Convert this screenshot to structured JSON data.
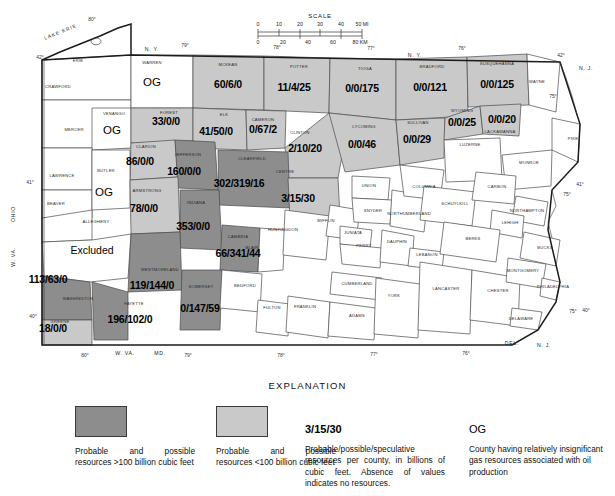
{
  "map": {
    "title_geographic": "Pennsylvania gas resources by county",
    "lake_label": "LAKE ERIE",
    "scale": {
      "title": "SCALE",
      "miles_ticks": [
        "0",
        "10",
        "20",
        "30",
        "40",
        "50 MI"
      ],
      "km_ticks": [
        "0",
        "20",
        "40",
        "60",
        "80 KM"
      ]
    },
    "neighbors": [
      {
        "name": "N. Y.",
        "x": 152,
        "y": 51
      },
      {
        "name": "N. Y.",
        "x": 415,
        "y": 57
      },
      {
        "name": "OHIO",
        "x": 15,
        "y": 214
      },
      {
        "name": "W. VA.",
        "x": 15,
        "y": 257
      },
      {
        "name": "W. VA.",
        "x": 125,
        "y": 355
      },
      {
        "name": "MD.",
        "x": 160,
        "y": 355
      },
      {
        "name": "DEL.",
        "x": 512,
        "y": 345
      },
      {
        "name": "N. J.",
        "x": 544,
        "y": 347
      },
      {
        "name": "N. J.",
        "x": 586,
        "y": 70
      }
    ],
    "graticule_labels": [
      {
        "t": "42°",
        "x": 40,
        "y": 59
      },
      {
        "t": "42°",
        "x": 561,
        "y": 57
      },
      {
        "t": "41°",
        "x": 30,
        "y": 184
      },
      {
        "t": "41°",
        "x": 580,
        "y": 186
      },
      {
        "t": "40°",
        "x": 33,
        "y": 318
      },
      {
        "t": "40°",
        "x": 586,
        "y": 312
      },
      {
        "t": "80°",
        "x": 92,
        "y": 21
      },
      {
        "t": "80°",
        "x": 85,
        "y": 357
      },
      {
        "t": "79°",
        "x": 185,
        "y": 47
      },
      {
        "t": "79°",
        "x": 188,
        "y": 357
      },
      {
        "t": "78°",
        "x": 277,
        "y": 49
      },
      {
        "t": "78°",
        "x": 281,
        "y": 357
      },
      {
        "t": "77°",
        "x": 371,
        "y": 50
      },
      {
        "t": "77°",
        "x": 374,
        "y": 356
      },
      {
        "t": "76°",
        "x": 462,
        "y": 50
      },
      {
        "t": "76°",
        "x": 466,
        "y": 355
      },
      {
        "t": "75°",
        "x": 553,
        "y": 98
      },
      {
        "t": "75°",
        "x": 567,
        "y": 196
      },
      {
        "t": "75°",
        "x": 573,
        "y": 313
      }
    ],
    "counties": [
      {
        "name": "ERIE",
        "shade": "none",
        "value": null,
        "lx": 78,
        "ly": 62
      },
      {
        "name": "CRAWFORD",
        "shade": "none",
        "value": null,
        "lx": 58,
        "ly": 88
      },
      {
        "name": "WARREN",
        "shade": "none",
        "value": "OG",
        "lx": 152,
        "ly": 64,
        "vx": 152,
        "vy": 86
      },
      {
        "name": "MCKEAN",
        "shade": "light",
        "value": "60/6/0",
        "lx": 228,
        "ly": 66,
        "vx": 228,
        "vy": 88
      },
      {
        "name": "POTTER",
        "shade": "light",
        "value": "11/4/25",
        "lx": 299,
        "ly": 68,
        "vx": 294,
        "vy": 91
      },
      {
        "name": "TIOGA",
        "shade": "light",
        "value": "0/0/175",
        "lx": 365,
        "ly": 70,
        "vx": 362,
        "vy": 92
      },
      {
        "name": "BRADFORD",
        "shade": "light",
        "value": "0/0/121",
        "lx": 432,
        "ly": 68,
        "vx": 430,
        "vy": 91
      },
      {
        "name": "SUSQUEHANNA",
        "shade": "light",
        "value": "0/0/125",
        "lx": 497,
        "ly": 65,
        "vx": 497,
        "vy": 88
      },
      {
        "name": "WAYNE",
        "shade": "none",
        "value": null,
        "lx": 537,
        "ly": 83
      },
      {
        "name": "VENANGO",
        "shade": "none",
        "value": "OG",
        "lx": 114,
        "ly": 115,
        "vx": 112,
        "vy": 134
      },
      {
        "name": "FOREST",
        "shade": "light",
        "value": "33/0/0",
        "lx": 169,
        "ly": 114,
        "vx": 166,
        "vy": 125
      },
      {
        "name": "ELK",
        "shade": "light",
        "value": "41/50/0",
        "lx": 224,
        "ly": 116,
        "vx": 216,
        "vy": 135
      },
      {
        "name": "CAMERON",
        "shade": "light",
        "value": "0/67/2",
        "lx": 263,
        "ly": 121,
        "vx": 263,
        "vy": 133
      },
      {
        "name": "CLINTON",
        "shade": "light",
        "value": "2/10/20",
        "lx": 300,
        "ly": 134,
        "vx": 305,
        "vy": 152
      },
      {
        "name": "LYCOMING",
        "shade": "light",
        "value": "0/0/46",
        "lx": 364,
        "ly": 128,
        "vx": 362,
        "vy": 148
      },
      {
        "name": "SULLIVAN",
        "shade": "light",
        "value": "0/0/29",
        "lx": 418,
        "ly": 124,
        "vx": 417,
        "vy": 143
      },
      {
        "name": "WYOMING",
        "shade": "light",
        "value": "0/0/25",
        "lx": 462,
        "ly": 112,
        "vx": 462,
        "vy": 126
      },
      {
        "name": "LACKAWANNA",
        "shade": "light",
        "value": "0/0/20",
        "lx": 500,
        "ly": 133,
        "vx": 502,
        "vy": 123
      },
      {
        "name": "MERCER",
        "shade": "none",
        "value": null,
        "lx": 74,
        "ly": 131
      },
      {
        "name": "CLARION",
        "shade": "light",
        "value": "86/0/0",
        "lx": 146,
        "ly": 148,
        "vx": 140,
        "vy": 165
      },
      {
        "name": "JEFFERSON",
        "shade": "dark",
        "value": "160/0/0",
        "lx": 188,
        "ly": 156,
        "vx": 184,
        "vy": 175
      },
      {
        "name": "CLEARFIELD",
        "shade": "dark",
        "value": "302/319/16",
        "lx": 252,
        "ly": 160,
        "vx": 239,
        "vy": 187
      },
      {
        "name": "CENTRE",
        "shade": "light",
        "value": "3/15/30",
        "lx": 285,
        "ly": 173,
        "vx": 298,
        "vy": 202
      },
      {
        "name": "LUZERNE",
        "shade": "none",
        "value": null,
        "lx": 470,
        "ly": 146
      },
      {
        "name": "MONROE",
        "shade": "none",
        "value": null,
        "lx": 529,
        "ly": 164
      },
      {
        "name": "PIKE",
        "shade": "none",
        "value": null,
        "lx": 573,
        "ly": 140
      },
      {
        "name": "LAWRENCE",
        "shade": "none",
        "value": null,
        "lx": 62,
        "ly": 177
      },
      {
        "name": "BUTLER",
        "shade": "none",
        "value": "OG",
        "lx": 106,
        "ly": 172,
        "vx": 104,
        "vy": 196
      },
      {
        "name": "ARMSTRONG",
        "shade": "light",
        "value": "78/0/0",
        "lx": 147,
        "ly": 192,
        "vx": 144,
        "vy": 212
      },
      {
        "name": "INDIANA",
        "shade": "dark",
        "value": "353/0/0",
        "lx": 196,
        "ly": 204,
        "vx": 193,
        "vy": 230
      },
      {
        "name": "CAMBRIA",
        "shade": "dark",
        "value": "66/341/44",
        "lx": 238,
        "ly": 238,
        "vx": 238,
        "vy": 257
      },
      {
        "name": "BLAIR",
        "shade": "none",
        "value": null,
        "lx": 252,
        "ly": 249
      },
      {
        "name": "HUNTINGDON",
        "shade": "none",
        "value": null,
        "lx": 283,
        "ly": 231
      },
      {
        "name": "MIFFLIN",
        "shade": "none",
        "value": null,
        "lx": 326,
        "ly": 222
      },
      {
        "name": "UNION",
        "shade": "none",
        "value": null,
        "lx": 369,
        "ly": 187
      },
      {
        "name": "SNYDER",
        "shade": "none",
        "value": null,
        "lx": 373,
        "ly": 212
      },
      {
        "name": "NORTHUMBERLAND",
        "shade": "none",
        "value": null,
        "lx": 409,
        "ly": 215
      },
      {
        "name": "COLUMBIA",
        "shade": "none",
        "value": null,
        "lx": 424,
        "ly": 188
      },
      {
        "name": "JUNIATA",
        "shade": "none",
        "value": null,
        "lx": 353,
        "ly": 234
      },
      {
        "name": "PERRY",
        "shade": "none",
        "value": null,
        "lx": 364,
        "ly": 247
      },
      {
        "name": "DAUPHIN",
        "shade": "none",
        "value": null,
        "lx": 397,
        "ly": 243
      },
      {
        "name": "SCHUYLKILL",
        "shade": "none",
        "value": null,
        "lx": 455,
        "ly": 205
      },
      {
        "name": "CARBON",
        "shade": "none",
        "value": null,
        "lx": 497,
        "ly": 188
      },
      {
        "name": "NORTHAMPTON",
        "shade": "none",
        "value": null,
        "lx": 527,
        "ly": 212
      },
      {
        "name": "LEHIGH",
        "shade": "none",
        "value": null,
        "lx": 510,
        "ly": 224
      },
      {
        "name": "LEBANON",
        "shade": "none",
        "value": null,
        "lx": 427,
        "ly": 256
      },
      {
        "name": "BERKS",
        "shade": "none",
        "value": null,
        "lx": 473,
        "ly": 240
      },
      {
        "name": "BUCKS",
        "shade": "none",
        "value": null,
        "lx": 545,
        "ly": 249
      },
      {
        "name": "BEAVER",
        "shade": "none",
        "value": null,
        "lx": 56,
        "ly": 205
      },
      {
        "name": "ALLEGHENY",
        "shade": "excl",
        "value": "Excluded",
        "lx": 96,
        "ly": 223,
        "vx": 92,
        "vy": 254
      },
      {
        "name": "WESTMORELAND",
        "shade": "dark",
        "value": "119/144/0",
        "lx": 160,
        "ly": 271,
        "vx": 152,
        "vy": 289
      },
      {
        "name": "SOMERSET",
        "shade": "dark",
        "value": "0/147/59",
        "lx": 201,
        "ly": 288,
        "vx": 200,
        "vy": 312
      },
      {
        "name": "WASHINGTON",
        "shade": "dark",
        "value": "113/63/0",
        "lx": 78,
        "ly": 300,
        "vx": 48,
        "vy": 283
      },
      {
        "name": "FAYETTE",
        "shade": "dark",
        "value": "196/102/0",
        "lx": 134,
        "ly": 305,
        "vx": 130,
        "vy": 323
      },
      {
        "name": "GREENE",
        "shade": "light",
        "value": "18/0/0",
        "lx": 60,
        "ly": 323,
        "vx": 53,
        "vy": 332
      },
      {
        "name": "BEDFORD",
        "shade": "none",
        "value": null,
        "lx": 245,
        "ly": 287
      },
      {
        "name": "FULTON",
        "shade": "none",
        "value": null,
        "lx": 272,
        "ly": 309
      },
      {
        "name": "FRANKLIN",
        "shade": "none",
        "value": null,
        "lx": 305,
        "ly": 308
      },
      {
        "name": "CUMBERLAND",
        "shade": "none",
        "value": null,
        "lx": 357,
        "ly": 285
      },
      {
        "name": "ADAMS",
        "shade": "none",
        "value": null,
        "lx": 357,
        "ly": 317
      },
      {
        "name": "YORK",
        "shade": "none",
        "value": null,
        "lx": 394,
        "ly": 297
      },
      {
        "name": "LANCASTER",
        "shade": "none",
        "value": null,
        "lx": 446,
        "ly": 290
      },
      {
        "name": "CHESTER",
        "shade": "none",
        "value": null,
        "lx": 498,
        "ly": 292
      },
      {
        "name": "MONTGOMERY",
        "shade": "none",
        "value": null,
        "lx": 523,
        "ly": 272
      },
      {
        "name": "PHILADELPHIA",
        "shade": "none",
        "value": null,
        "lx": 553,
        "ly": 288
      },
      {
        "name": "DELAWARE",
        "shade": "none",
        "value": null,
        "lx": 521,
        "ly": 320
      }
    ]
  },
  "explanation": {
    "title": "EXPLANATION",
    "items": [
      {
        "kind": "swatch-dark",
        "swatch_color": "#8d8d8d",
        "text": "Probable and possible resources >100 billion cubic feet"
      },
      {
        "kind": "swatch-light",
        "swatch_color": "#c9c9c9",
        "text": "Probable and possible resources <100 billion cubic feet"
      },
      {
        "kind": "symbol",
        "symbol": "3/15/30",
        "text": "Probable/possible/speculative resources per county, in billions of cubic feet. Absence of values indicates no resources."
      },
      {
        "kind": "symbol",
        "symbol": "OG",
        "text": "County having relatively insignificant gas resources associated with oil production"
      }
    ]
  }
}
